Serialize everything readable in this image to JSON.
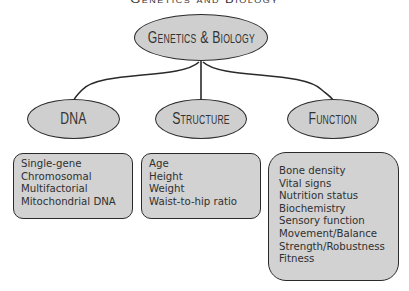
{
  "title": "Genetics and Biology",
  "root": {
    "label": "Genetics & Biology"
  },
  "categories": [
    {
      "label": "DNA",
      "items": [
        "Single-gene",
        "Chromosomal",
        "Multifactorial",
        "Mitochondrial DNA"
      ]
    },
    {
      "label": "Structure",
      "items": [
        "Age",
        "Height",
        "Weight",
        "Waist-to-hip ratio"
      ]
    },
    {
      "label": "Function",
      "items": [
        "Bone density",
        "Vital signs",
        "Nutrition status",
        "Biochemistry",
        "Sensory function",
        "Movement/Balance",
        "Strength/Robustness",
        "Fitness"
      ]
    }
  ],
  "colors": {
    "node_fill": "#cfcfcf",
    "stroke": "#2a2a2a",
    "text": "#333333"
  }
}
